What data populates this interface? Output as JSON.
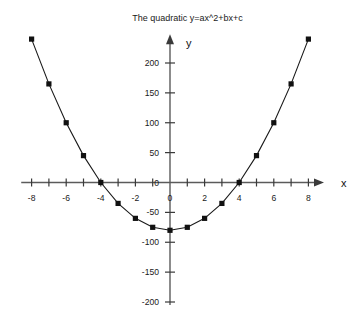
{
  "chart_data": {
    "type": "line",
    "title": "The quadratic y=ax^2+bx+c",
    "xlabel": "x",
    "ylabel": "y",
    "x": [
      -8,
      -7,
      -6,
      -5,
      -4,
      -3,
      -2,
      -1,
      0,
      1,
      2,
      3,
      4,
      5,
      6,
      7,
      8
    ],
    "values": [
      240,
      165,
      100,
      45,
      0,
      -35,
      -60,
      -75,
      -80,
      -75,
      -60,
      -35,
      0,
      45,
      100,
      165,
      240
    ],
    "series": [
      {
        "name": "y=5x^2-80",
        "values": [
          240,
          165,
          100,
          45,
          0,
          -35,
          -60,
          -75,
          -80,
          -75,
          -60,
          -35,
          0,
          45,
          100,
          165,
          240
        ]
      }
    ],
    "xlim": [
      -8.6,
      8.9
    ],
    "ylim": [
      -205,
      248
    ],
    "xticks": [
      -8,
      -7,
      -6,
      -5,
      -4,
      -3,
      -2,
      -1,
      0,
      1,
      2,
      3,
      4,
      5,
      6,
      7,
      8
    ],
    "xticklabels": [
      "-8",
      "",
      "-6",
      "",
      "-4",
      "",
      "-2",
      "",
      "0",
      "",
      "2",
      "",
      "4",
      "",
      "6",
      "",
      "8"
    ],
    "yticks": [
      200,
      150,
      100,
      50,
      0,
      -50,
      -100,
      -150,
      -200
    ],
    "yticklabels": [
      "200",
      "150",
      "100",
      "50",
      "0",
      "-50",
      "-100",
      "-150",
      "-200"
    ],
    "grid": false,
    "legend": false,
    "marker": "square",
    "axes_style": "crossed-at-origin-with-arrows",
    "colors": {
      "background": "#ffffff",
      "axis": "#5b5b5b",
      "curve": "#1a1a1a",
      "marker": "#111111",
      "text": "#1a1a1a"
    }
  }
}
